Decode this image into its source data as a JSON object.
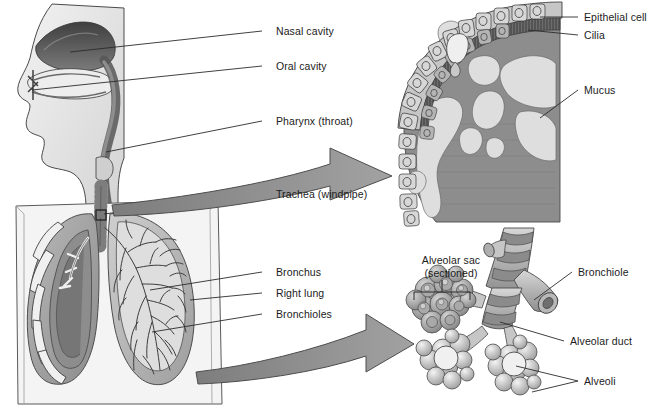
{
  "figure": {
    "background_color": "#ffffff",
    "ink_color": "#1b1b1b"
  },
  "palette": {
    "outline": "#3a3a3a",
    "skin_light": "#ebebeb",
    "skin_mid": "#d8d8d8",
    "cavity_dark": "#4a4a4a",
    "cavity_mid": "#6e6e6e",
    "lung_mid": "#9a9a9a",
    "lung_light": "#c9c9c9",
    "lung_dark": "#7c7c7c",
    "arrow_fill": "#8f8f8f",
    "arrow_stroke": "#4d4d4d",
    "tissue_dark": "#8a8a8a",
    "mucus_light": "#dcdcdc",
    "cell_light": "#d2d2d2",
    "cell_mid": "#a8a8a8"
  },
  "labels": {
    "main": [
      {
        "id": "nasal-cavity",
        "text": "Nasal cavity",
        "x": 276,
        "y": 31
      },
      {
        "id": "oral-cavity",
        "text": "Oral cavity",
        "x": 276,
        "y": 66
      },
      {
        "id": "pharynx",
        "text": "Pharynx (throat)",
        "x": 276,
        "y": 121
      },
      {
        "id": "trachea",
        "text": "Trachea (windpipe)",
        "x": 276,
        "y": 194
      },
      {
        "id": "bronchus",
        "text": "Bronchus",
        "x": 276,
        "y": 272
      },
      {
        "id": "right-lung",
        "text": "Right lung",
        "x": 276,
        "y": 293
      },
      {
        "id": "bronchioles",
        "text": "Bronchioles",
        "x": 276,
        "y": 314
      }
    ],
    "epithelium_inset": [
      {
        "id": "epithelial-cell",
        "text": "Epithelial cell",
        "x": 584,
        "y": 17
      },
      {
        "id": "cilia",
        "text": "Cilia",
        "x": 584,
        "y": 35
      },
      {
        "id": "mucus",
        "text": "Mucus",
        "x": 584,
        "y": 90
      }
    ],
    "alveoli_inset": [
      {
        "id": "bronchiole",
        "text": "Bronchiole",
        "x": 578,
        "y": 272
      },
      {
        "id": "alveolar-duct",
        "text": "Alveolar duct",
        "x": 570,
        "y": 341
      },
      {
        "id": "alveoli",
        "text": "Alveoli",
        "x": 584,
        "y": 381
      }
    ],
    "alveolar_sac": {
      "id": "alveolar-sac",
      "line1": "Alveolar sac",
      "line2": "(sectioned)",
      "x": 421,
      "y": 262
    }
  },
  "arrows": [
    {
      "id": "arrow-to-epithelium",
      "from": "trachea wall",
      "to": "epithelium inset",
      "direction": "right"
    },
    {
      "id": "arrow-to-alveoli",
      "from": "lung bronchioles",
      "to": "alveoli inset",
      "direction": "right"
    }
  ]
}
